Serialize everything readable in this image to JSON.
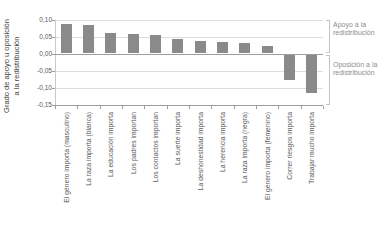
{
  "chart_data": {
    "type": "bar",
    "title": "",
    "ylabel": "Grado de apoyo u oposición a la redistribución",
    "ylabel_lines": [
      "Grado de apoyo u oposición",
      "a la redistribución"
    ],
    "xlabel": "",
    "categories": [
      "El género importa (masculino)",
      "La raza importa (blanca)",
      "La educación importa",
      "Los padres importan",
      "Los contactos importan",
      "La suerte importa",
      "La deshonestidad importa",
      "La herencia importa",
      "La raza importa (negra)",
      "El género importa (femenino)",
      "Correr riesgos importa",
      "Trabajar mucho importa"
    ],
    "values": [
      0.088,
      0.084,
      0.059,
      0.057,
      0.053,
      0.044,
      0.036,
      0.034,
      0.031,
      0.021,
      -0.075,
      -0.112
    ],
    "ylim": [
      -0.15,
      0.1
    ],
    "ytick_values": [
      0.1,
      0.05,
      0.0,
      -0.05,
      -0.1,
      -0.15
    ],
    "ytick_labels": [
      "0,10",
      "0,05",
      "0,00",
      "-0,05",
      "-0,10",
      "-0,15"
    ],
    "grid": true,
    "legend": false,
    "bar_color": "#8a8a8a",
    "annotations": [
      {
        "label": "Apoyo a la redistribución",
        "side": "positive"
      },
      {
        "label": "Oposición a la redistribución",
        "side": "negative"
      }
    ]
  }
}
